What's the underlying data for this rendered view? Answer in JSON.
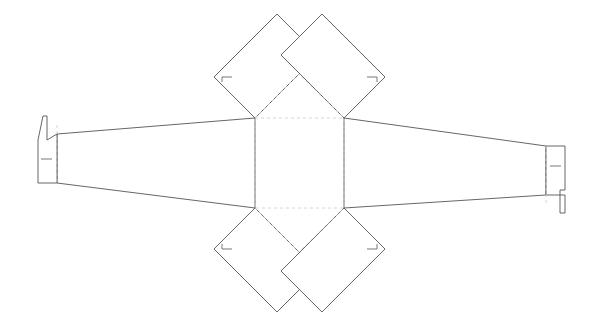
{
  "document": {
    "type": "packaging-dieline",
    "title": "Box Dieline Template",
    "background_color": "#ffffff",
    "width": 603,
    "height": 329
  },
  "styles": {
    "cut_line_color": "#555555",
    "fold_line_color": "#c9c9c9",
    "tick_color": "#6a6a6a",
    "cut_line_width": 0.9,
    "fold_line_width": 0.8,
    "fold_dash_pattern": "3 3"
  },
  "geometry": {
    "center_panel": {
      "name": "base-panel",
      "left": 255,
      "top": 118,
      "right": 344,
      "bottom": 208,
      "line_type": "fold"
    },
    "top_left_diamond": {
      "name": "top-left-flap",
      "points": "255,118 214,77 277,14 318,55",
      "line_type": "cut"
    },
    "top_right_diamond": {
      "name": "top-right-flap",
      "points": "344,118 385,77 322,14 281,55",
      "line_type": "cut"
    },
    "bottom_left_diamond": {
      "name": "bottom-left-flap",
      "points": "255,208 214,249 277,312 318,271",
      "line_type": "cut"
    },
    "bottom_right_diamond": {
      "name": "bottom-right-flap",
      "points": "344,208 385,249 322,312 281,271",
      "line_type": "cut"
    },
    "top_fold_triangle": {
      "name": "top-fold-triangle",
      "points": "255,118 299,74 344,118",
      "line_type": "fold"
    },
    "bottom_fold_triangle": {
      "name": "bottom-fold-triangle",
      "points": "255,208 299,252 344,208",
      "line_type": "fold"
    },
    "left_wing": {
      "name": "left-tapered-wing",
      "points": "255,118 57,134 57,183 255,208",
      "line_type": "cut"
    },
    "right_wing": {
      "name": "right-tapered-wing",
      "points": "344,118 546,146 546,195 344,208",
      "line_type": "cut"
    },
    "left_flap": {
      "name": "left-bottle-flap",
      "outline": "57,134 57,183 38,183 38,140 43,116 47,116 47,140 57,134",
      "neck_top_y": 116,
      "line_type": "cut"
    },
    "right_flap": {
      "name": "right-bottle-flap",
      "outline": "546,146 546,195 565,195 565,213 560,213 560,190 565,190 565,146",
      "neck_bottom_y": 213,
      "line_type": "cut"
    },
    "left_flap_fold": {
      "name": "left-flap-fold-line",
      "x": 57,
      "y1": 125,
      "y2": 183
    },
    "right_flap_fold": {
      "name": "right-flap-fold-line",
      "x": 546,
      "y1": 146,
      "y2": 204
    },
    "tick_marks": [
      {
        "name": "tick-left-flap-glue",
        "x1": 41,
        "y1": 159,
        "x2": 52,
        "y2": 159
      },
      {
        "name": "tick-right-flap-glue",
        "x1": 550,
        "y1": 166,
        "x2": 561,
        "y2": 166
      },
      {
        "name": "tick-top-left-corner",
        "x1": 222,
        "y1": 77,
        "x2": 232,
        "y2": 77
      },
      {
        "name": "tick-top-left-corner-vert",
        "x1": 222,
        "y1": 77,
        "x2": 222,
        "y2": 82
      },
      {
        "name": "tick-top-right-corner",
        "x1": 367,
        "y1": 77,
        "x2": 377,
        "y2": 77
      },
      {
        "name": "tick-top-right-corner-vert",
        "x1": 377,
        "y1": 77,
        "x2": 377,
        "y2": 82
      },
      {
        "name": "tick-bottom-left-corner",
        "x1": 222,
        "y1": 249,
        "x2": 232,
        "y2": 249
      },
      {
        "name": "tick-bottom-left-corner-vert",
        "x1": 222,
        "y1": 244,
        "x2": 222,
        "y2": 249
      },
      {
        "name": "tick-bottom-right-corner",
        "x1": 367,
        "y1": 249,
        "x2": 377,
        "y2": 249
      },
      {
        "name": "tick-bottom-right-corner-vert",
        "x1": 377,
        "y1": 244,
        "x2": 377,
        "y2": 249
      }
    ]
  }
}
